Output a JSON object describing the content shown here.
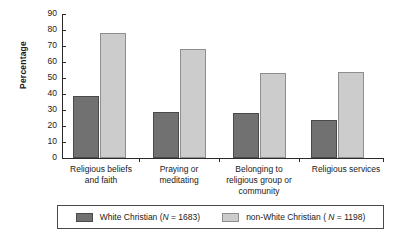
{
  "chart_data": {
    "type": "bar",
    "title": "",
    "xlabel": "",
    "ylabel": "Percentage",
    "ylim": [
      0,
      90
    ],
    "yticks": [
      0,
      10,
      20,
      30,
      40,
      50,
      60,
      70,
      80,
      90
    ],
    "grid": false,
    "legend_position": "bottom",
    "categories": [
      "Religious beliefs and faith",
      "Praying or meditating",
      "Belonging to religious group or community",
      "Religious services"
    ],
    "series": [
      {
        "name": "White Christian (N = 1683)",
        "color": "#717171",
        "values": [
          39,
          29,
          28,
          24
        ]
      },
      {
        "name": "non-White Christian ( N = 1198)",
        "color": "#cccccc",
        "values": [
          78,
          68,
          53,
          54
        ]
      }
    ]
  },
  "axis": {
    "y_title": "Percentage",
    "y_ticks": [
      "0",
      "10",
      "20",
      "30",
      "40",
      "50",
      "60",
      "70",
      "80",
      "90"
    ],
    "x_categories": [
      {
        "line1": "Religious beliefs",
        "line2": "and faith",
        "line3": ""
      },
      {
        "line1": "Praying or",
        "line2": "meditating",
        "line3": ""
      },
      {
        "line1": "Belonging to",
        "line2": "religious group or",
        "line3": "community"
      },
      {
        "line1": "Religious services",
        "line2": "",
        "line3": ""
      }
    ]
  },
  "legend": {
    "items": [
      {
        "swatch": "dark",
        "prefix": "White Christian (",
        "italic": "N",
        "suffix": " = 1683)"
      },
      {
        "swatch": "light",
        "prefix": "non-White Christian ( ",
        "italic": "N",
        "suffix": " = 1198)"
      }
    ]
  }
}
